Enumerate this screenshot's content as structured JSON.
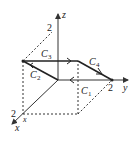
{
  "diagram": {
    "type": "3d-axes-with-closed-curve",
    "axes": {
      "x": {
        "label": "x",
        "tick": "2"
      },
      "y": {
        "label": "y",
        "tick": "2"
      },
      "z": {
        "label": "z",
        "tick": "2"
      }
    },
    "x_point_label": "x",
    "curves": [
      {
        "name": "C",
        "sub": "1"
      },
      {
        "name": "C",
        "sub": "2"
      },
      {
        "name": "C",
        "sub": "3"
      },
      {
        "name": "C",
        "sub": "4"
      }
    ],
    "colors": {
      "line": "#333333",
      "background": "#ffffff"
    }
  }
}
